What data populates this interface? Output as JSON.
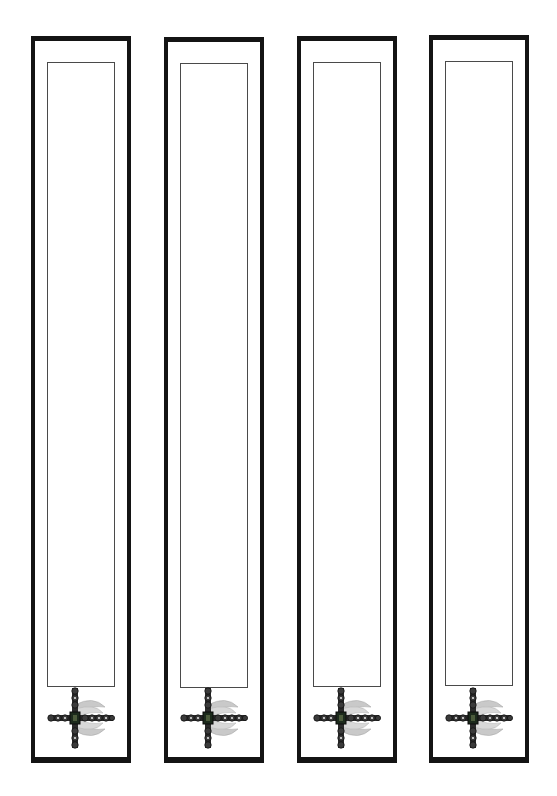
{
  "page": {
    "background": "#ffffff",
    "frame_color": "#141414",
    "inner_border_color": "#4a4a4a"
  },
  "bookmarks": [
    {
      "id": 1,
      "ornament": "winged-cross-icon",
      "text": ""
    },
    {
      "id": 2,
      "ornament": "winged-cross-icon",
      "text": ""
    },
    {
      "id": 3,
      "ornament": "winged-cross-icon",
      "text": ""
    },
    {
      "id": 4,
      "ornament": "winged-cross-icon",
      "text": ""
    }
  ]
}
